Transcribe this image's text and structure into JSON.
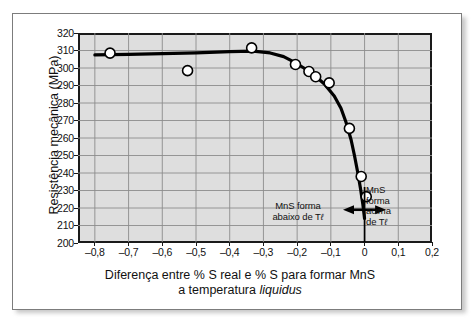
{
  "chart_data": {
    "type": "scatter",
    "title": "",
    "xlabel": "Diferença entre % S real e % S para formar MnS a temperatura liquidus",
    "xlabel_line1": "Diferença entre % S real e % S para formar MnS",
    "xlabel_line2_pre": "a temperatura ",
    "xlabel_line2_em": "liquidus",
    "ylabel": "Resistência mecânica (MPa)",
    "xlim": [
      -0.85,
      0.2
    ],
    "ylim": [
      200,
      320
    ],
    "xticks": [
      -0.8,
      -0.7,
      -0.6,
      -0.5,
      -0.4,
      -0.3,
      -0.2,
      -0.1,
      0,
      0.1,
      0.2
    ],
    "xticklabels": [
      "–0,8",
      "–0,7",
      "–0,6",
      "–0,5",
      "–0,4",
      "–0,3",
      "–0,2",
      "–0,1",
      "0",
      "0,1",
      "0,2"
    ],
    "yticks": [
      200,
      210,
      220,
      230,
      240,
      250,
      260,
      270,
      280,
      290,
      300,
      310,
      320
    ],
    "yticklabels": [
      "200",
      "210",
      "220",
      "230",
      "240",
      "250",
      "260",
      "270",
      "280",
      "290",
      "300",
      "310",
      "320"
    ],
    "grid": true,
    "legend": "none",
    "series": [
      {
        "name": "Resistência mecânica",
        "marker": "open-circle",
        "points": [
          {
            "x": -0.755,
            "y": 308.5
          },
          {
            "x": -0.525,
            "y": 298.5
          },
          {
            "x": -0.335,
            "y": 311.5
          },
          {
            "x": -0.205,
            "y": 302.0
          },
          {
            "x": -0.165,
            "y": 298.0
          },
          {
            "x": -0.145,
            "y": 295.0
          },
          {
            "x": -0.105,
            "y": 291.5
          },
          {
            "x": -0.045,
            "y": 265.5
          },
          {
            "x": -0.01,
            "y": 238.0
          },
          {
            "x": 0.005,
            "y": 226.5
          }
        ]
      }
    ],
    "fit_curve": {
      "name": "curva ajustada",
      "points": [
        {
          "x": -0.8,
          "y": 307.5
        },
        {
          "x": -0.7,
          "y": 307.8
        },
        {
          "x": -0.6,
          "y": 308.2
        },
        {
          "x": -0.5,
          "y": 308.7
        },
        {
          "x": -0.4,
          "y": 309.3
        },
        {
          "x": -0.33,
          "y": 309.6
        },
        {
          "x": -0.28,
          "y": 308.6
        },
        {
          "x": -0.24,
          "y": 306.5
        },
        {
          "x": -0.21,
          "y": 303.5
        },
        {
          "x": -0.18,
          "y": 300.0
        },
        {
          "x": -0.15,
          "y": 296.0
        },
        {
          "x": -0.12,
          "y": 291.0
        },
        {
          "x": -0.09,
          "y": 284.0
        },
        {
          "x": -0.07,
          "y": 277.0
        },
        {
          "x": -0.055,
          "y": 269.0
        },
        {
          "x": -0.04,
          "y": 259.0
        },
        {
          "x": -0.03,
          "y": 250.0
        },
        {
          "x": -0.02,
          "y": 240.0
        },
        {
          "x": -0.012,
          "y": 231.0
        },
        {
          "x": -0.005,
          "y": 222.0
        },
        {
          "x": 0.0,
          "y": 214.0
        }
      ]
    },
    "annotations": [
      {
        "name": "left-region-note",
        "line1": "MnS forma",
        "line2_pre": "abaixo de T",
        "line2_sub": "ℓ",
        "x_text": -0.29,
        "y_text": 218
      },
      {
        "name": "right-region-note",
        "line1": "MnS",
        "line2": "forma",
        "line3": "acima",
        "line4_pre": "de T",
        "line4_sub": "ℓ",
        "x_text": 0.035,
        "y_text": 228
      }
    ],
    "divider_line": {
      "x": 0.0,
      "y_from": 200,
      "y_to": 232
    },
    "arrow": {
      "x_center": 0.0,
      "y": 219,
      "x_left": -0.055,
      "x_right": 0.055,
      "double_headed": true
    },
    "colors": {
      "plot_background": "#dedede",
      "grid": "#8c8c8c",
      "axis": "#1a1a1a",
      "curve": "#000000",
      "marker_fill": "#ffffff",
      "marker_edge": "#000000",
      "page_background": "#ffffff",
      "frame": "#7c7c7c",
      "text": "#111111"
    }
  }
}
